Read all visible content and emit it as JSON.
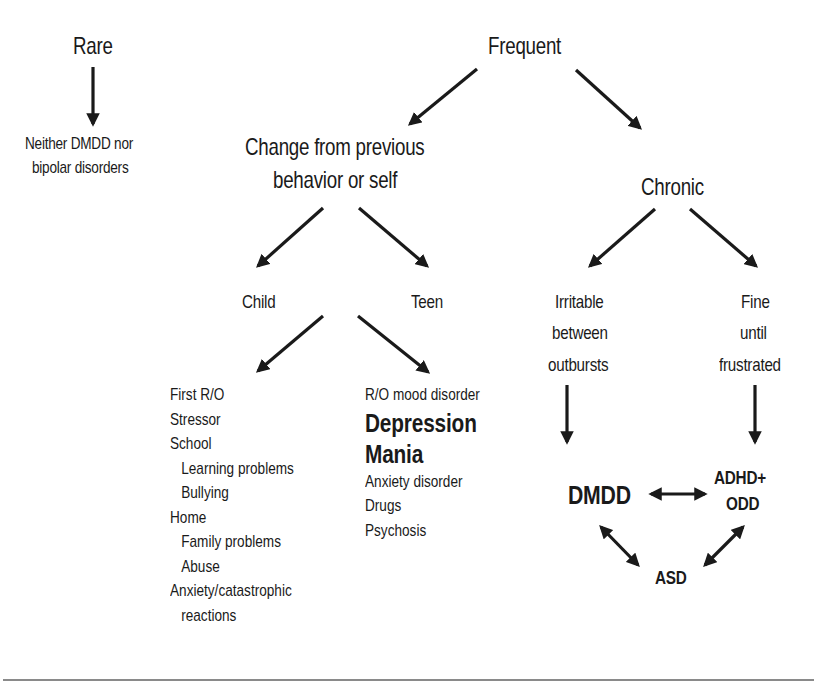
{
  "diagram": {
    "nodes": {
      "rare": "Rare",
      "rare_outcome_line1": "Neither DMDD nor",
      "rare_outcome_line2": "bipolar disorders",
      "frequent": "Frequent",
      "change_line1": "Change from previous",
      "change_line2": "behavior or self",
      "chronic": "Chronic",
      "child": "Child",
      "teen": "Teen",
      "irritable_line1": "Irritable",
      "irritable_line2": "between",
      "irritable_line3": "outbursts",
      "fine_line1": "Fine",
      "fine_line2": "until",
      "fine_line3": "frustrated",
      "dmdd": "DMDD",
      "adhd_line1": "ADHD+",
      "adhd_line2": "ODD",
      "asd": "ASD"
    },
    "child_list": [
      {
        "text": "First R/O",
        "indent": false
      },
      {
        "text": "Stressor",
        "indent": false
      },
      {
        "text": "School",
        "indent": false
      },
      {
        "text": "Learning problems",
        "indent": true
      },
      {
        "text": "Bullying",
        "indent": true
      },
      {
        "text": "Home",
        "indent": false
      },
      {
        "text": "Family problems",
        "indent": true
      },
      {
        "text": "Abuse",
        "indent": true
      },
      {
        "text": "Anxiety/catastrophic",
        "indent": false
      },
      {
        "text": "reactions",
        "indent": true
      }
    ],
    "teen_list": [
      {
        "text": "R/O mood disorder",
        "emphasis": false
      },
      {
        "text": "Depression",
        "emphasis": true
      },
      {
        "text": "Mania",
        "emphasis": true
      },
      {
        "text": "Anxiety disorder",
        "emphasis": false
      },
      {
        "text": "Drugs",
        "emphasis": false
      },
      {
        "text": "Psychosis",
        "emphasis": false
      }
    ],
    "edges": [
      {
        "from": "Rare",
        "to": "Neither DMDD nor bipolar disorders",
        "type": "arrow"
      },
      {
        "from": "Frequent",
        "to": "Change from previous behavior or self",
        "type": "arrow"
      },
      {
        "from": "Frequent",
        "to": "Chronic",
        "type": "arrow"
      },
      {
        "from": "Change from previous behavior or self",
        "to": "Child",
        "type": "arrow"
      },
      {
        "from": "Change from previous behavior or self",
        "to": "Teen",
        "type": "arrow"
      },
      {
        "from": "Child",
        "to": "First R/O list",
        "type": "arrow"
      },
      {
        "from": "Teen",
        "to": "R/O mood disorder list",
        "type": "arrow"
      },
      {
        "from": "Chronic",
        "to": "Irritable between outbursts",
        "type": "arrow"
      },
      {
        "from": "Chronic",
        "to": "Fine until frustrated",
        "type": "arrow"
      },
      {
        "from": "Irritable between outbursts",
        "to": "DMDD",
        "type": "arrow"
      },
      {
        "from": "Fine until frustrated",
        "to": "ADHD+ODD",
        "type": "arrow"
      },
      {
        "from": "DMDD",
        "to": "ADHD+ODD",
        "type": "bidirectional"
      },
      {
        "from": "DMDD",
        "to": "ASD",
        "type": "bidirectional"
      },
      {
        "from": "ADHD+ODD",
        "to": "ASD",
        "type": "bidirectional"
      }
    ],
    "colors": {
      "ink": "#1a1a1a",
      "rule": "#8a8a8a",
      "background": "#ffffff"
    }
  }
}
